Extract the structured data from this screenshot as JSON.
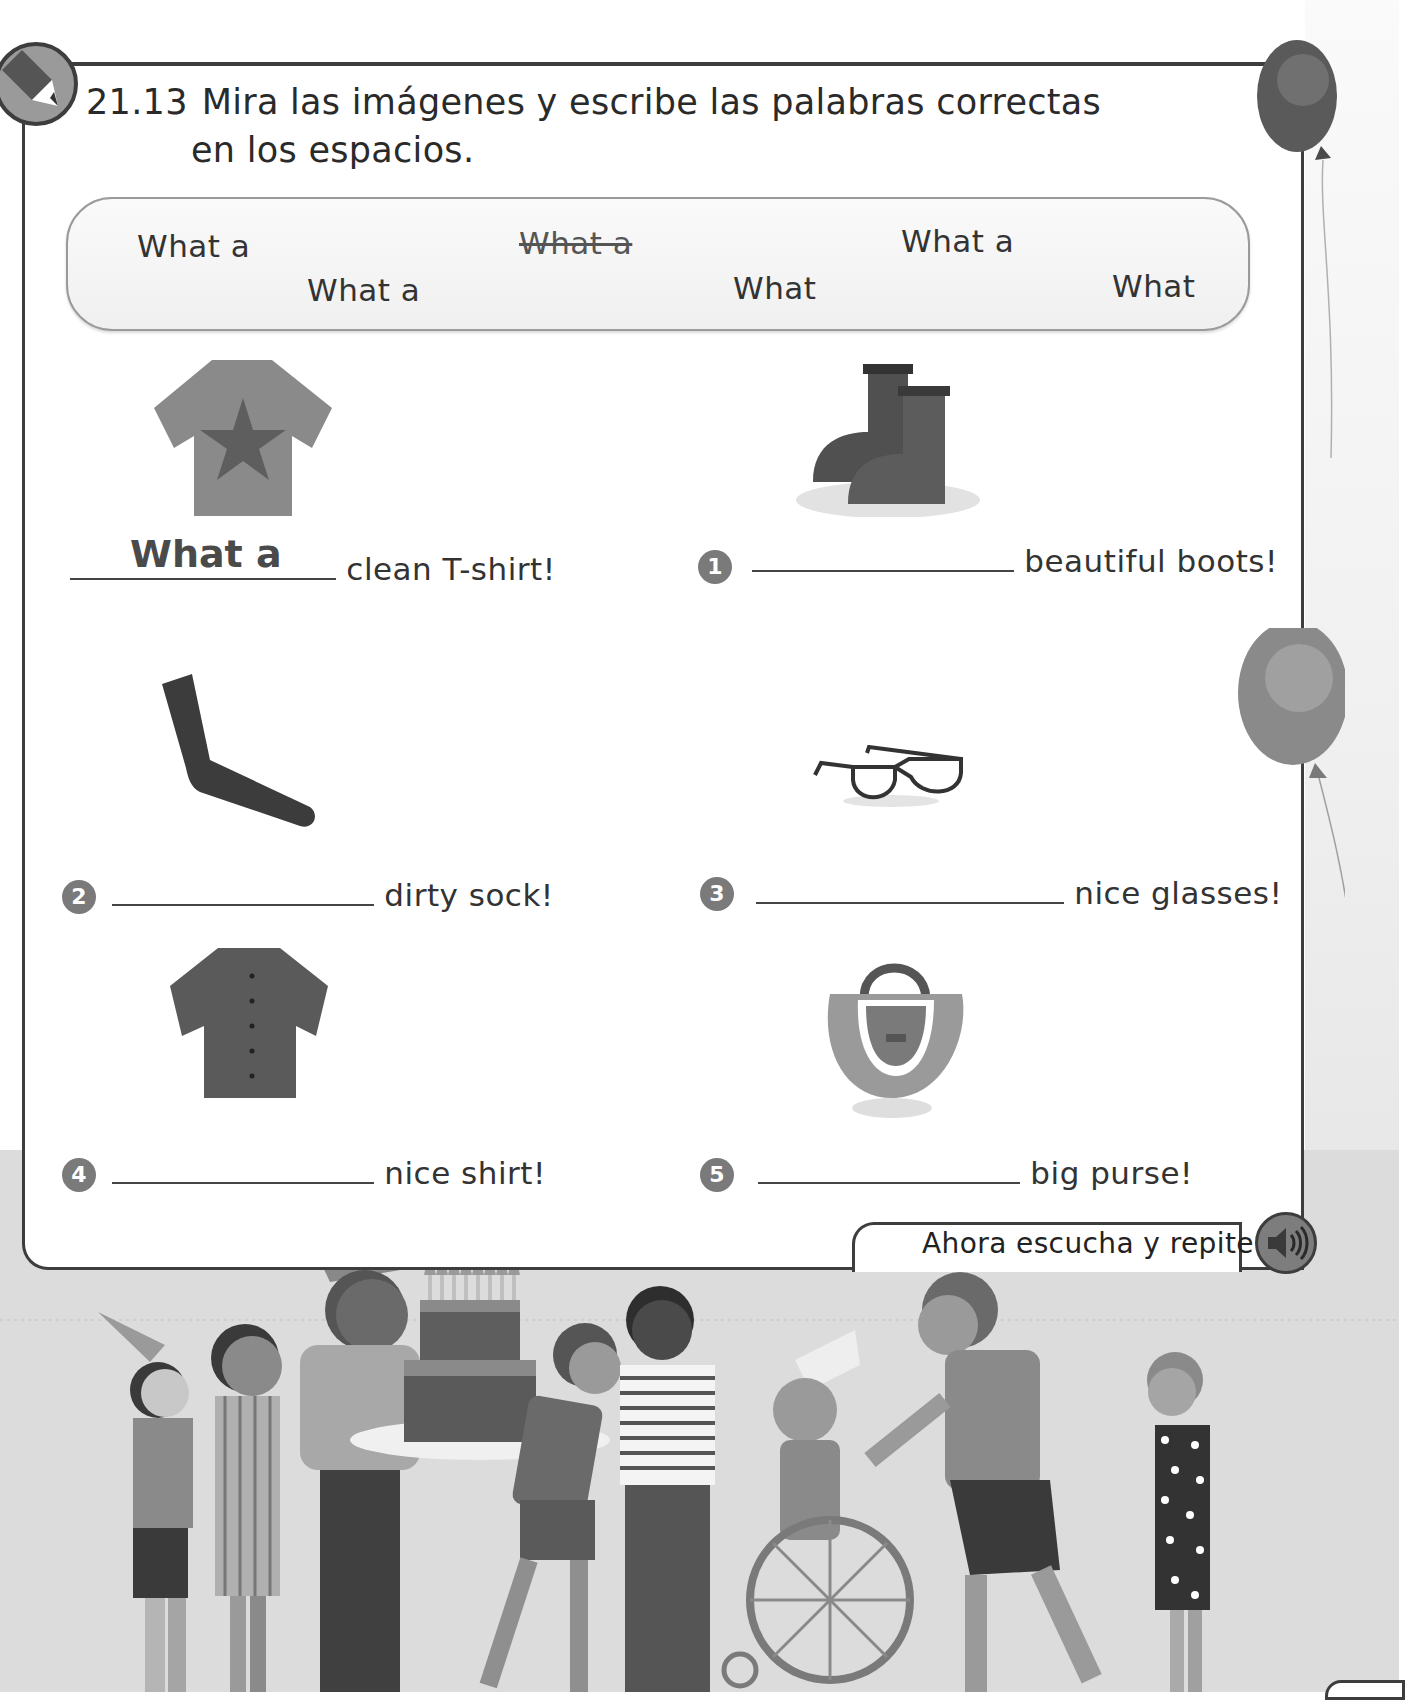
{
  "exercise": {
    "number": "21.13",
    "instruction_line1": "Mira las imágenes y escribe las palabras correctas",
    "instruction_line2": "en los espacios."
  },
  "word_bank": {
    "words": [
      {
        "text": "What a",
        "struck": false
      },
      {
        "text": "What a",
        "struck": true
      },
      {
        "text": "What a",
        "struck": false
      },
      {
        "text": "What a",
        "struck": false
      },
      {
        "text": "What",
        "struck": false
      },
      {
        "text": "What",
        "struck": false
      }
    ]
  },
  "items": [
    {
      "number": "",
      "image": "t-shirt-icon",
      "answer": "What a",
      "suffix": "clean T-shirt!"
    },
    {
      "number": "1",
      "image": "boots-icon",
      "answer": "",
      "suffix": "beautiful boots!"
    },
    {
      "number": "2",
      "image": "sock-icon",
      "answer": "",
      "suffix": "dirty sock!"
    },
    {
      "number": "3",
      "image": "glasses-icon",
      "answer": "",
      "suffix": "nice glasses!"
    },
    {
      "number": "4",
      "image": "shirt-icon",
      "answer": "",
      "suffix": "nice shirt!"
    },
    {
      "number": "5",
      "image": "purse-icon",
      "answer": "",
      "suffix": "big purse!"
    }
  ],
  "listen": {
    "label": "Ahora escucha y repite.",
    "icon": "speaker-icon"
  },
  "illustration": {
    "scene": "birthday-party-illustration",
    "decorations": [
      "balloon-icon",
      "balloon-icon"
    ]
  },
  "colors": {
    "frame": "#3d3d3d",
    "badge": "#7a7a7a",
    "background_scene": "#dcdcdc"
  }
}
